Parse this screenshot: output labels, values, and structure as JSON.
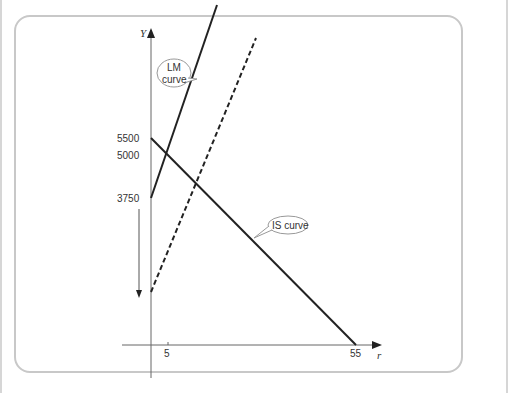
{
  "diagram": {
    "type": "IS-LM diagram",
    "axes": {
      "y_label": "Y",
      "x_label": "r",
      "y_ticks": [
        "5500",
        "5000",
        "3750"
      ],
      "x_ticks": [
        "5",
        "55"
      ]
    },
    "curves": [
      {
        "name": "LM curve",
        "style": "solid",
        "callout_line1": "LM",
        "callout_line2": "curve"
      },
      {
        "name": "LM curve shifted",
        "style": "dashed"
      },
      {
        "name": "IS curve",
        "style": "solid",
        "callout": "IS curve"
      }
    ],
    "annotations": {
      "downward_arrow": "shift down"
    },
    "colors": {
      "line": "#222222",
      "axis": "#555555",
      "frame": "#c8c8c8",
      "callout_border": "#999999"
    }
  }
}
